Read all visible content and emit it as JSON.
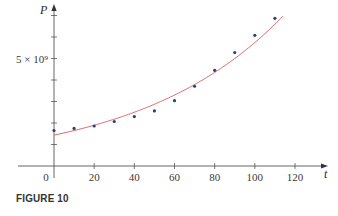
{
  "caption": "FIGURE 10",
  "colors": {
    "axis": "#555555",
    "curve": "#e06a6a",
    "points": "#2b3f7a",
    "text": "#333333"
  },
  "chart_data": {
    "type": "scatter",
    "title": "",
    "caption": "FIGURE 10",
    "xlabel": "t",
    "ylabel": "P",
    "xlim": [
      -7,
      130
    ],
    "ylim": [
      0,
      7300000000.0
    ],
    "x_ticks": [
      0,
      20,
      40,
      60,
      80,
      100,
      120
    ],
    "x_tick_labels": [
      "0",
      "20",
      "40",
      "60",
      "80",
      "100",
      "120"
    ],
    "y_ticks": [
      1000000000.0,
      2000000000.0,
      3000000000.0,
      4000000000.0,
      5000000000.0,
      6000000000.0,
      7000000000.0
    ],
    "y_tick_labels": [
      "",
      "",
      "",
      "",
      "5 × 10⁹",
      "",
      ""
    ],
    "grid": false,
    "legend": null,
    "series": [
      {
        "name": "data",
        "kind": "scatter",
        "x": [
          0,
          10,
          20,
          30,
          40,
          50,
          60,
          70,
          80,
          90,
          100,
          110
        ],
        "values": [
          1650000000.0,
          1750000000.0,
          1860000000.0,
          2070000000.0,
          2300000000.0,
          2560000000.0,
          3040000000.0,
          3710000000.0,
          4450000000.0,
          5280000000.0,
          6080000000.0,
          6870000000.0
        ]
      },
      {
        "name": "exponential model",
        "kind": "line",
        "model": "P = 1.4365e9 * (1.01395)^t",
        "x_range": [
          0,
          114
        ]
      }
    ]
  }
}
